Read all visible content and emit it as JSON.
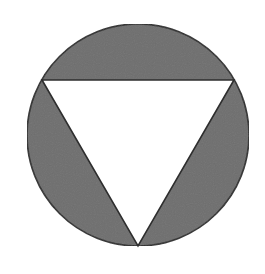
{
  "figure": {
    "circle": {
      "cx": 138,
      "cy": 135,
      "r": 111
    },
    "triangle": {
      "orientation": "pointing-down",
      "vertices": [
        [
          42,
          80
        ],
        [
          234,
          80
        ],
        [
          138,
          246
        ]
      ]
    },
    "colors": {
      "shaded_segment": "#6e6e6e",
      "triangle_fill": "#ffffff",
      "outline": "#2e2e2e",
      "background": "#ffffff"
    }
  }
}
